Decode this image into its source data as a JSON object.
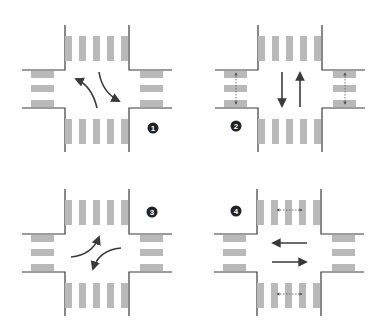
{
  "figure": {
    "colors": {
      "curb": "#3a3a3a",
      "stripe": "#b9b9b9",
      "arrow": "#3a3a3a",
      "badge": "#222222"
    },
    "panels": [
      {
        "id": 1,
        "badge": "1",
        "badge_pos": [
          153,
          128
        ],
        "origin": [
          0,
          0
        ],
        "movements": [
          "left turn from south (curving up-left)",
          "right turn from north (curving down-right)"
        ],
        "pedestrian_crossings": []
      },
      {
        "id": 2,
        "badge": "2",
        "badge_pos": [
          236,
          126
        ],
        "origin": [
          194,
          0
        ],
        "movements": [
          "southbound through",
          "northbound through"
        ],
        "pedestrian_crossings": [
          "west crosswalk",
          "east crosswalk"
        ]
      },
      {
        "id": 3,
        "badge": "3",
        "badge_pos": [
          152,
          212
        ],
        "origin": [
          0,
          163
        ],
        "movements": [
          "left turn from west (curving up-right)",
          "left turn from east (curving down-left)"
        ],
        "pedestrian_crossings": []
      },
      {
        "id": 4,
        "badge": "4",
        "badge_pos": [
          236,
          211
        ],
        "origin": [
          192,
          163
        ],
        "movements": [
          "westbound through",
          "eastbound through"
        ],
        "pedestrian_crossings": [
          "north crosswalk",
          "south crosswalk"
        ]
      }
    ]
  }
}
